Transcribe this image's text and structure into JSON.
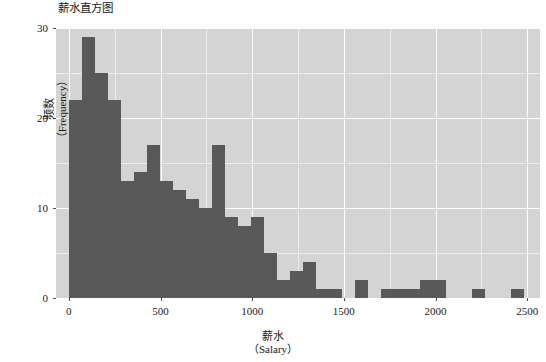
{
  "chart_data": {
    "type": "bar",
    "title": "薪水直方图",
    "xlabel_line1": "薪水",
    "xlabel_line2": "（Salary）",
    "ylabel_line1": "频数",
    "ylabel_line2": "（Frequency）",
    "xlim": [
      -70,
      2570
    ],
    "ylim": [
      0,
      30
    ],
    "xticks": [
      0,
      500,
      1000,
      1500,
      2000,
      2500
    ],
    "xtick_labels": [
      "0",
      "500",
      "1000",
      "1500",
      "2000",
      "2500"
    ],
    "yticks": [
      0,
      10,
      20,
      30
    ],
    "ytick_labels": [
      "0",
      "10",
      "20",
      "30"
    ],
    "grid": true,
    "legend": null,
    "bin_width": 71,
    "bin_starts": [
      0,
      71,
      142,
      213,
      284,
      355,
      426,
      497,
      568,
      639,
      710,
      781,
      852,
      923,
      994,
      1065,
      1136,
      1207,
      1278,
      1349,
      1420,
      1491,
      1562,
      1633,
      1704,
      1775,
      1846,
      1917,
      1988,
      2059,
      2130,
      2201,
      2272,
      2343,
      2414
    ],
    "values": [
      22,
      29,
      25,
      22,
      13,
      14,
      17,
      13,
      12,
      11,
      10,
      17,
      9,
      8,
      9,
      5,
      2,
      3,
      4,
      1,
      1,
      0,
      2,
      0,
      1,
      1,
      1,
      2,
      2,
      0,
      0,
      1,
      0,
      0,
      1
    ],
    "bar_color": "#595959",
    "plot_background": "#d4d4d4",
    "gridline_color": "#ffffff",
    "figure_background": "#ffffff"
  }
}
